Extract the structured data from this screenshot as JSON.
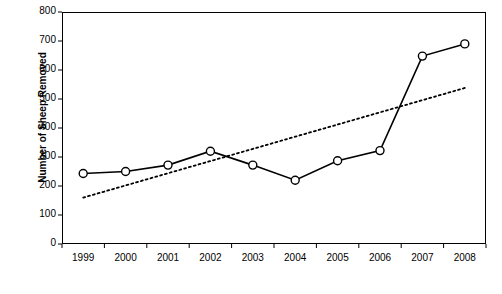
{
  "chart_data": {
    "type": "line",
    "title": "",
    "xlabel": "",
    "ylabel": "Number of Sheep Removed",
    "categories": [
      "1999",
      "2000",
      "2001",
      "2002",
      "2003",
      "2004",
      "2005",
      "2006",
      "2007",
      "2008"
    ],
    "ylim": [
      0,
      800
    ],
    "y_ticks": [
      0,
      100,
      200,
      300,
      400,
      500,
      600,
      700,
      800
    ],
    "grid": false,
    "legend": "none",
    "series": [
      {
        "name": "Sheep removed",
        "style": "solid-line-with-open-circle-markers",
        "color": "#000000",
        "values": [
          243,
          250,
          272,
          320,
          272,
          220,
          287,
          322,
          648,
          690
        ]
      },
      {
        "name": "Trend line",
        "style": "dotted-line",
        "color": "#000000",
        "values": [
          160,
          202,
          244,
          286,
          328,
          370,
          412,
          454,
          496,
          538
        ]
      }
    ]
  }
}
